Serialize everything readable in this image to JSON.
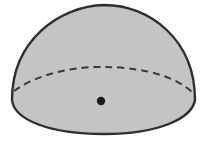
{
  "diagram": {
    "shape": "hemisphere",
    "colors": {
      "fill": "#c4c4c4",
      "stroke": "#2e2e2e",
      "background": "#ffffff",
      "center_point": "#1a1a1a"
    },
    "elements": {
      "dome_outline": {
        "style": "solid"
      },
      "equator": {
        "style": "dashed",
        "visibility": "hidden back edge"
      },
      "base_front": {
        "style": "solid"
      },
      "center_point": {
        "style": "filled dot"
      }
    }
  }
}
